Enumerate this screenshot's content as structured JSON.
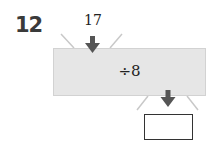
{
  "question": {
    "number": "12"
  },
  "function_machine": {
    "input": "17",
    "operation": "÷8",
    "output": ""
  },
  "colors": {
    "machine_fill": "#e6e6e6",
    "arrow": "#555555"
  }
}
